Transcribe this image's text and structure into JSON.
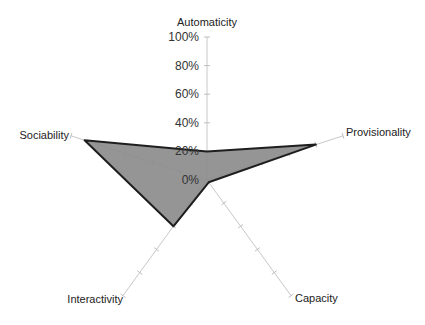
{
  "chart_data": {
    "type": "radar",
    "title": "",
    "categories": [
      "Automaticity",
      "Provisionality",
      "Capacity",
      "Interactivity",
      "Sociability"
    ],
    "series": [
      {
        "name": "Series 1",
        "values": [
          20,
          80,
          2,
          40,
          90
        ]
      }
    ],
    "tick_labels": [
      "0%",
      "20%",
      "40%",
      "60%",
      "80%",
      "100%"
    ],
    "rlim": [
      0,
      100
    ],
    "grid": false,
    "legend": "none",
    "colors": {
      "fill": "#8c8c8c",
      "stroke": "#1e1e1e",
      "axis": "#c8c8c8"
    }
  }
}
